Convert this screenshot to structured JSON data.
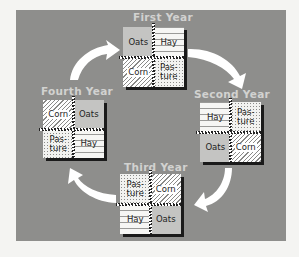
{
  "diagram": {
    "type": "crop-rotation-cycle",
    "colors": {
      "panel_background": "#8e8e8c",
      "label_color": "#d2d2d0",
      "arrow_color": "#ffffff",
      "oats_fill": "#c4c4c2"
    },
    "years": [
      {
        "label": "First Year",
        "fields": [
          {
            "crop": "Oats",
            "lines": [
              "Oats"
            ],
            "pattern": "oats"
          },
          {
            "crop": "Hay",
            "lines": [
              "Hay"
            ],
            "pattern": "hay"
          },
          {
            "crop": "Corn",
            "lines": [
              "Corn"
            ],
            "pattern": "corn"
          },
          {
            "crop": "Pasture",
            "lines": [
              "Pas-",
              "ture"
            ],
            "pattern": "pasture"
          }
        ]
      },
      {
        "label": "Second  Year",
        "fields": [
          {
            "crop": "Hay",
            "lines": [
              "Hay"
            ],
            "pattern": "hay"
          },
          {
            "crop": "Pasture",
            "lines": [
              "Pas-",
              "ture"
            ],
            "pattern": "pasture"
          },
          {
            "crop": "Oats",
            "lines": [
              "Oats"
            ],
            "pattern": "oats"
          },
          {
            "crop": "Corn",
            "lines": [
              "Corn"
            ],
            "pattern": "corn"
          }
        ]
      },
      {
        "label": "Third Year",
        "fields": [
          {
            "crop": "Pasture",
            "lines": [
              "Pas-",
              "ture"
            ],
            "pattern": "pasture"
          },
          {
            "crop": "Corn",
            "lines": [
              "Corn"
            ],
            "pattern": "corn"
          },
          {
            "crop": "Hay",
            "lines": [
              "Hay"
            ],
            "pattern": "hay"
          },
          {
            "crop": "Oats",
            "lines": [
              "Oats"
            ],
            "pattern": "oats"
          }
        ]
      },
      {
        "label": "Fourth Year",
        "fields": [
          {
            "crop": "Corn",
            "lines": [
              "Corn"
            ],
            "pattern": "corn"
          },
          {
            "crop": "Oats",
            "lines": [
              "Oats"
            ],
            "pattern": "oats"
          },
          {
            "crop": "Pasture",
            "lines": [
              "Pas-",
              "ture"
            ],
            "pattern": "pasture"
          },
          {
            "crop": "Hay",
            "lines": [
              "Hay"
            ],
            "pattern": "hay"
          }
        ]
      }
    ],
    "arrows": [
      {
        "from": "First Year",
        "to": "Second  Year",
        "direction": "clockwise"
      },
      {
        "from": "Second  Year",
        "to": "Third Year",
        "direction": "clockwise"
      },
      {
        "from": "Third Year",
        "to": "Fourth Year",
        "direction": "clockwise"
      },
      {
        "from": "Fourth Year",
        "to": "First Year",
        "direction": "clockwise"
      }
    ]
  }
}
